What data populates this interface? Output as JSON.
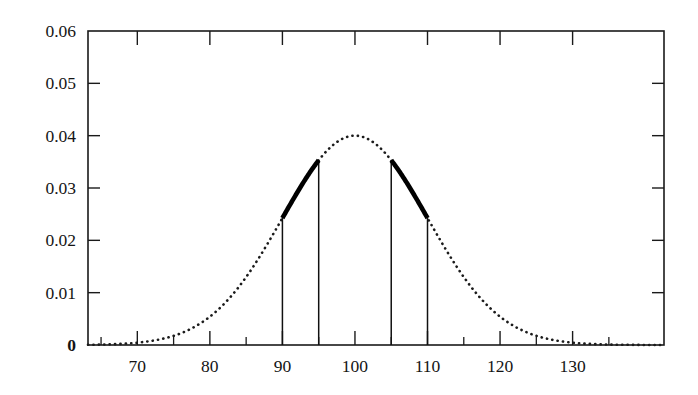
{
  "chart_data": {
    "type": "line",
    "title": "",
    "xlabel": "",
    "ylabel": "",
    "xlim": [
      63.2,
      142.6
    ],
    "ylim": [
      0,
      0.06
    ],
    "grid": false,
    "legend": null,
    "distribution": {
      "kind": "normal-pdf",
      "mean": 100,
      "sigma": 10,
      "peak_value": 0.04
    },
    "x_ticks_major": [
      70,
      80,
      90,
      100,
      110,
      120,
      130
    ],
    "x_tick_labels": [
      "70",
      "80",
      "90",
      "100",
      "110",
      "120",
      "130"
    ],
    "x_ticks_minor": [
      65,
      75,
      85,
      95,
      105,
      115,
      125,
      135
    ],
    "y_ticks": [
      0,
      0.01,
      0.02,
      0.03,
      0.04,
      0.05,
      0.06
    ],
    "y_tick_labels": [
      "0",
      "0.01",
      "0.02",
      "0.03",
      "0.04",
      "0.05",
      "0.06"
    ],
    "curve_style": "dotted",
    "highlight_style": "bold-solid",
    "highlighted_intervals": [
      {
        "x_start": 90,
        "x_end": 95,
        "y_start": 0.0242,
        "y_end": 0.0352
      },
      {
        "x_start": 105,
        "x_end": 110,
        "y_start": 0.0352,
        "y_end": 0.0242
      }
    ],
    "drop_lines": [
      {
        "x": 90,
        "y": 0.0242
      },
      {
        "x": 95,
        "y": 0.0352
      },
      {
        "x": 105,
        "y": 0.0352
      },
      {
        "x": 110,
        "y": 0.0242
      }
    ],
    "annotations": [],
    "colors": {
      "curve": "#1b1b1b",
      "highlight": "#000000",
      "axis": "#1a1a1a",
      "background": "#ffffff"
    }
  },
  "plot_box": {
    "left": 88,
    "right": 664,
    "top": 31,
    "bottom": 345
  }
}
